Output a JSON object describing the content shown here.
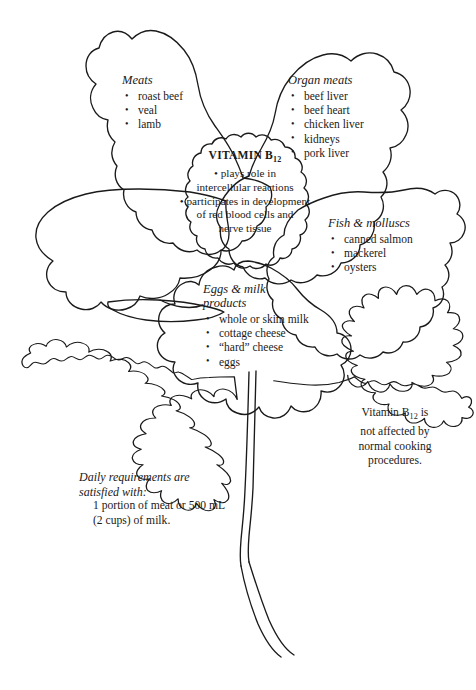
{
  "figure": {
    "stroke_color": "#1a1a1a",
    "background_color": "#ffffff"
  },
  "center": {
    "title_text": "VITAMIN B",
    "title_subscript": "12",
    "bullets": [
      "plays role in intercellular reactions",
      "participates in development of red blood cells and nerve tissue"
    ],
    "lines": [
      "• plays role in",
      "intercellular reactions",
      "• participates in development",
      "of red blood cells and",
      "nerve tissue"
    ]
  },
  "petals": [
    {
      "id": "meats",
      "heading": "Meats",
      "items": [
        "roast beef",
        "veal",
        "lamb"
      ]
    },
    {
      "id": "organ-meats",
      "heading": "Organ meats",
      "items": [
        "beef liver",
        "beef heart",
        "chicken liver",
        "kidneys",
        "pork liver"
      ]
    },
    {
      "id": "fish-molluscs",
      "heading": "Fish & molluscs",
      "items": [
        "canned salmon",
        "mackerel",
        "oysters"
      ]
    },
    {
      "id": "eggs-milk",
      "heading": "Eggs & milk\n    products",
      "items": [
        "whole or skim milk",
        "cottage cheese",
        "“hard” cheese",
        "eggs"
      ]
    },
    {
      "id": "blank-left",
      "heading": "",
      "items": []
    }
  ],
  "leaves": [
    {
      "id": "daily-requirements",
      "heading_line1": "Daily requirements are",
      "heading_line2": "satisfied with:",
      "body_line1": "1 portion of meat or 500 mL",
      "body_line2": "(2 cups) of milk."
    },
    {
      "id": "cooking-note",
      "text_pre": "Vitamin B",
      "text_sub": "12",
      "text_post": " is not affected by normal cooking procedures.",
      "lines": [
        "Vitamin B12 is",
        "not affected by",
        "normal cooking",
        "procedures."
      ]
    }
  ]
}
